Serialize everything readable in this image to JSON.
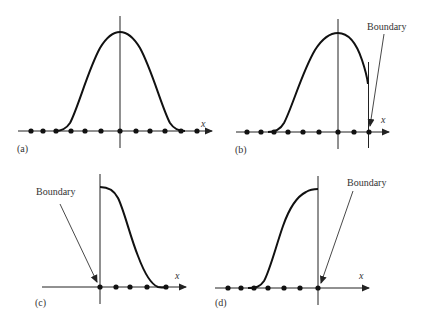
{
  "figure": {
    "panels": [
      {
        "id": "a",
        "label": "(a)",
        "axis_label": "x",
        "description": "Full smoothing kernel centered on particle, away from boundary",
        "boundary_label": null
      },
      {
        "id": "b",
        "label": "(b)",
        "axis_label": "x",
        "description": "Kernel truncated by boundary on right side",
        "boundary_label": "Boundary"
      },
      {
        "id": "c",
        "label": "(c)",
        "axis_label": "x",
        "description": "Particle at left boundary, half kernel to the right",
        "boundary_label": "Boundary"
      },
      {
        "id": "d",
        "label": "(d)",
        "axis_label": "x",
        "description": "Particle at right boundary, half kernel to the left",
        "boundary_label": "Boundary"
      }
    ],
    "colors": {
      "background": "#ffffff",
      "ink": "#111111",
      "text": "#333333"
    }
  }
}
